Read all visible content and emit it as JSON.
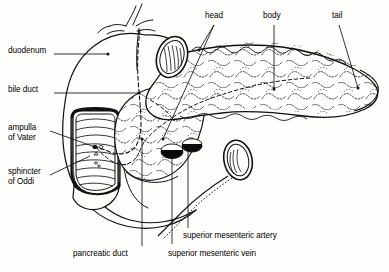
{
  "figure": {
    "style": "black-and-white line drawing",
    "background_color": "#fdfdfb",
    "line_color": "#000000"
  },
  "labels": [
    {
      "key": "duodenum",
      "text": "duodenum",
      "x": 8,
      "y": 50,
      "align": "left"
    },
    {
      "key": "bile_duct",
      "text": "bile duct",
      "x": 8,
      "y": 89,
      "align": "left"
    },
    {
      "key": "ampulla",
      "text": "ampulla",
      "x": 8,
      "y": 127,
      "align": "left"
    },
    {
      "key": "ampulla2",
      "text": "of Vater",
      "x": 8,
      "y": 137,
      "align": "left"
    },
    {
      "key": "sphincter",
      "text": "sphincter",
      "x": 8,
      "y": 171,
      "align": "left"
    },
    {
      "key": "sphincter2",
      "text": "of Oddi",
      "x": 8,
      "y": 181,
      "align": "left"
    },
    {
      "key": "head",
      "text": "head",
      "x": 206,
      "y": 14,
      "align": "left"
    },
    {
      "key": "body",
      "text": "body",
      "x": 263,
      "y": 14,
      "align": "left"
    },
    {
      "key": "tail",
      "text": "tail",
      "x": 331,
      "y": 14,
      "align": "left"
    },
    {
      "key": "pancreatic_duct",
      "text": "pancreatic duct",
      "x": 73,
      "y": 252,
      "align": "left"
    },
    {
      "key": "sma",
      "text": "superior mesenteric artery",
      "x": 183,
      "y": 234,
      "align": "left"
    },
    {
      "key": "smv",
      "text": "superior mesenteric vein",
      "x": 168,
      "y": 252,
      "align": "left"
    }
  ],
  "leaders": [
    {
      "key": "duodenum-leader",
      "from": [
        62,
        54
      ],
      "to": [
        108,
        54
      ],
      "dot": [
        108,
        54
      ]
    },
    {
      "key": "bile-duct-leader",
      "from": [
        62,
        93
      ],
      "to": [
        139,
        93
      ],
      "dot": [
        139,
        93
      ]
    },
    {
      "key": "ampulla-leader",
      "from": [
        52,
        130
      ],
      "to": [
        95,
        147
      ],
      "dot": [
        95,
        147
      ]
    },
    {
      "key": "sphincter-leader",
      "from": [
        52,
        174
      ],
      "to": [
        90,
        155
      ],
      "dot": [
        90,
        155
      ]
    },
    {
      "key": "head-leader",
      "from": [
        214,
        24
      ],
      "to": [
        199,
        50
      ],
      "dot": [
        199,
        50
      ]
    },
    {
      "key": "body-leader",
      "from": [
        272,
        24
      ],
      "to": [
        272,
        89
      ],
      "dot": [
        272,
        89
      ]
    },
    {
      "key": "tail-leader",
      "from": [
        338,
        24
      ],
      "to": [
        357,
        88
      ],
      "dot": [
        357,
        88
      ]
    },
    {
      "key": "pancreatic-duct-leader",
      "from": [
        142,
        248
      ],
      "to": [
        142,
        139
      ],
      "dot": [
        142,
        139
      ]
    },
    {
      "key": "smv-leader",
      "from": [
        172,
        246
      ],
      "to": [
        172,
        152
      ],
      "dot": [
        172,
        152
      ]
    },
    {
      "key": "sma-leader",
      "from": [
        187,
        229
      ],
      "to": [
        187,
        144
      ],
      "dot": [
        187,
        144
      ]
    },
    {
      "key": "head-inner-leader",
      "from": [
        214,
        24
      ],
      "to": [
        163,
        139
      ],
      "dot": [
        163,
        139
      ]
    }
  ],
  "structures": [
    {
      "key": "duodenum-c-loop",
      "name": "duodenum"
    },
    {
      "key": "duodenum-window",
      "name": "opened duodenal wall with mucosal folds"
    },
    {
      "key": "pancreas-body-tail",
      "name": "pancreas body and tail, lobulated"
    },
    {
      "key": "pancreas-head",
      "name": "pancreas head"
    },
    {
      "key": "pancreatic-duct",
      "name": "pancreatic duct"
    },
    {
      "key": "bile-duct",
      "name": "common bile duct"
    },
    {
      "key": "ampulla-of-vater",
      "name": "ampulla of Vater / major papilla"
    },
    {
      "key": "sma-vessel",
      "name": "superior mesenteric artery cross-section"
    },
    {
      "key": "smv-vessel",
      "name": "superior mesenteric vein cross-section"
    },
    {
      "key": "duodenal-cut-oval",
      "name": "cut end of duodenum (oval)"
    },
    {
      "key": "jejunum-cut-oval",
      "name": "cut end of jejunum (oval)"
    },
    {
      "key": "top-vessel-branches",
      "name": "branching vessels at superior border"
    }
  ]
}
